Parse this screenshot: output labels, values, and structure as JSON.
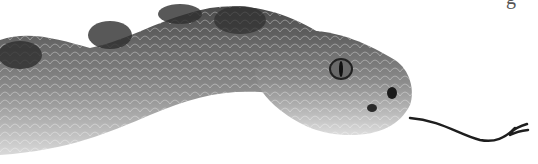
{
  "image": {
    "subject": "rattlesnake head and neck illustration with forked tongue",
    "style": "grayscale engraving",
    "cropped_text_fragment": "g",
    "colors": {
      "background": "#ffffff",
      "body_dark": "#3a3a3a",
      "body_mid": "#7a7a7a",
      "belly_light": "#d8d8d8",
      "tongue": "#1e1e1e"
    }
  }
}
